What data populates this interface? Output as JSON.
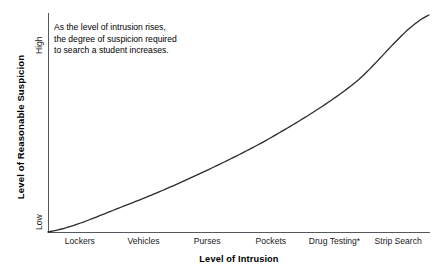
{
  "chart_data": {
    "type": "line",
    "title": "",
    "xlabel": "Level of Intrusion",
    "ylabel": "Level of Reasonable Suspicion",
    "categories": [
      "Lockers",
      "Vehicles",
      "Purses",
      "Pockets",
      "Drug Testing*",
      "Strip Search"
    ],
    "x": [
      1,
      2,
      3,
      4,
      5,
      6
    ],
    "values": [
      0,
      0.12,
      0.27,
      0.45,
      0.68,
      1.0
    ],
    "y_tick_labels": [
      "Low",
      "High"
    ],
    "ylim": [
      0,
      1
    ],
    "xlim": [
      0.5,
      6.5
    ],
    "grid": false,
    "legend": null,
    "curve_shape": "monotonic increasing convex (exponential-like)",
    "annotations": [
      "As the level of intrusion rises,",
      "the degree of suspicion required",
      "to search a student increases."
    ],
    "line_color": "#2b2b2b",
    "axis_color": "#55585c",
    "background_color": "#ffffff"
  },
  "axis": {
    "y_title": "Level of Reasonable Suspicion",
    "x_title": "Level of Intrusion",
    "y_low_label": "Low",
    "y_high_label": "High"
  },
  "annotation": {
    "line1": "As the level of intrusion rises,",
    "line2": "the degree of suspicion required",
    "line3": "to search a student increases."
  },
  "categories": [
    {
      "label": "Lockers"
    },
    {
      "label": "Vehicles"
    },
    {
      "label": "Purses"
    },
    {
      "label": "Pockets"
    },
    {
      "label": "Drug Testing*"
    },
    {
      "label": "Strip Search"
    }
  ]
}
